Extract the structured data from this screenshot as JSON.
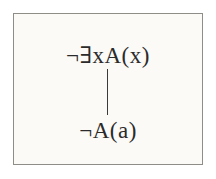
{
  "figure": {
    "type": "natural-deduction-derivation",
    "border_color": "#8e8d87",
    "background_color": "#fbfaf7",
    "text_color": "#2b2b2b",
    "line_color": "#3a3a3a"
  },
  "derivation": {
    "premise": {
      "text": "¬∃xA(x)",
      "role": "premise"
    },
    "inference": {
      "icon": "vertical-inference-line",
      "label": ""
    },
    "conclusion": {
      "text": "¬A(a)",
      "role": "conclusion"
    }
  }
}
